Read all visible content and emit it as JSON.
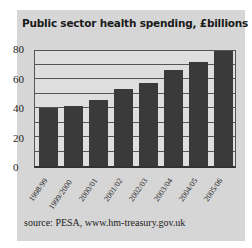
{
  "chart_data": {
    "type": "bar",
    "title": "Public sector health spending, £billions",
    "categories": [
      "1998/99",
      "1999/2000",
      "2000/01",
      "2001/02",
      "2002/03",
      "2003/04",
      "2004/05",
      "2005/06"
    ],
    "values": [
      40,
      41.5,
      45.5,
      53,
      57.5,
      66,
      71.5,
      79
    ],
    "xlabel": "",
    "ylabel": "",
    "ylim": [
      0,
      80
    ],
    "yticks": [
      "0",
      "20",
      "40",
      "60",
      "80"
    ],
    "grid": true,
    "grid_step": 10,
    "bar_color": "#3a3a3a",
    "source": "source: PESA, www.hm-treasury.gov.uk"
  }
}
